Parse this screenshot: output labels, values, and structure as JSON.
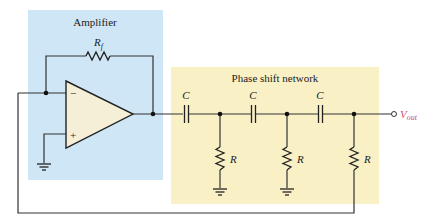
{
  "diagram": {
    "type": "circuit-schematic",
    "colors": {
      "amplifier_block": "#cfe6f6",
      "network_block": "#f9f0c6",
      "opamp_fill": "#f5efd8",
      "wire": "#333333",
      "output_label": "#d0506a"
    },
    "blocks": {
      "amplifier": {
        "label": "Amplifier"
      },
      "network": {
        "label": "Phase shift network"
      }
    },
    "components": {
      "feedback_resistor": {
        "label": "R",
        "subscript": "f"
      },
      "opamp": {
        "inverting_label": "−",
        "noninverting_label": "+"
      },
      "capacitors": [
        {
          "label": "C"
        },
        {
          "label": "C"
        },
        {
          "label": "C"
        }
      ],
      "shunt_resistors": [
        {
          "label": "R"
        },
        {
          "label": "R"
        },
        {
          "label": "R"
        }
      ]
    },
    "output": {
      "label": "V",
      "subscript": "out"
    }
  }
}
